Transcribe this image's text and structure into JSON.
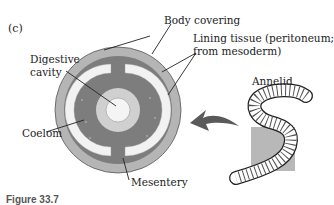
{
  "figure": {
    "panel_label": "(c)",
    "caption_partial": "Figure 33.7",
    "labels": {
      "body_covering": "Body covering",
      "lining_tissue_line1": "Lining tissue (peritoneum;",
      "lining_tissue_line2": "from mesoderm)",
      "digestive_line1": "Digestive",
      "digestive_line2": "cavity",
      "coelom": "Coelom",
      "mesentery": "Mesentery",
      "annelid": "Annelid"
    },
    "colors": {
      "body_covering": "#b5b5b5",
      "mesoderm": "#7d7d7d",
      "coelom": "#f2f2f2",
      "gut_lining": "#d0d0d0",
      "digestive_cavity": "#f4f4f4",
      "worm_box": "#b8b8b8",
      "arrow": "#5a5a5a"
    }
  }
}
